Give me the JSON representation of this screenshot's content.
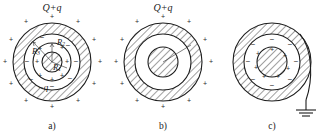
{
  "figure": {
    "background_color": "#ffffff",
    "ink_color": "#1d1d1d",
    "panels": [
      {
        "id": "a",
        "caption": "a)",
        "top_label": "Q+q",
        "inner_label": "-q",
        "radius_labels": [
          "R₁",
          "R₂",
          "R₃"
        ],
        "radius_label_r1": "R",
        "radius_label_r1_sub": "1",
        "radius_label_r2": "R",
        "radius_label_r2_sub": "2",
        "radius_label_r3": "R",
        "radius_label_r3_sub": "3",
        "center": {
          "x": 52,
          "y": 62
        },
        "radii": {
          "outer": 39,
          "shell_inner": 28,
          "gap_inner": 19,
          "core": 10
        },
        "shell_fill": "hatched",
        "gap_fill": "white",
        "core_fill": "hatched",
        "outer_charges": "+",
        "shell_inner_charges": "-",
        "gap_charges": "+",
        "core_edge_charges": "-",
        "grounded": false
      },
      {
        "id": "b",
        "caption": "b)",
        "top_label": "Q+q",
        "inner_label": "",
        "center": {
          "x": 163,
          "y": 62
        },
        "radii": {
          "outer": 39,
          "shell_inner": 28,
          "gap_inner": 19,
          "core": 19
        },
        "shell_fill": "hatched",
        "gap_fill": "white",
        "core_fill": "hatched",
        "outer_charges": "+",
        "shell_inner_charges": "",
        "gap_charges": "",
        "core_edge_charges": "",
        "grounded": false
      },
      {
        "id": "c",
        "caption": "c)",
        "top_label": "",
        "inner_label": "",
        "center": {
          "x": 272,
          "y": 62
        },
        "radii": {
          "outer": 39,
          "shell_inner": 28,
          "gap_inner": 19,
          "core": 19
        },
        "shell_fill": "hatched",
        "gap_fill": "white",
        "core_fill": "hatched",
        "outer_charges": "",
        "shell_inner_charges": "-",
        "gap_charges": "+",
        "core_edge_charges": "+",
        "grounded": true,
        "ground_symbol": "earth-ground"
      }
    ]
  },
  "panel_a": {
    "top_label": "Q+q",
    "q_label": "−q",
    "caption": "a)",
    "r1": "R",
    "r1_sub": "1",
    "r2": "R",
    "r2_sub": "2",
    "r3": "R",
    "r3_sub": "3"
  },
  "panel_b": {
    "top_label": "Q+q",
    "caption": "b)"
  },
  "panel_c": {
    "caption": "c)"
  },
  "charge_glyphs": {
    "plus": "+",
    "minus": "−"
  }
}
